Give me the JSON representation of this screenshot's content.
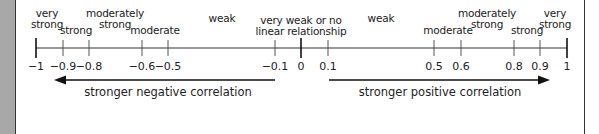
{
  "diagram": {
    "type": "correlation-strength-scale",
    "axis": {
      "min": -1,
      "max": 1
    },
    "ticks": [
      {
        "value": -1,
        "label": "−1",
        "x": 36,
        "major": true
      },
      {
        "value": -0.9,
        "label": "−0.9",
        "x": 63
      },
      {
        "value": -0.8,
        "label": "−0.8",
        "x": 89
      },
      {
        "value": -0.6,
        "label": "−0.6",
        "x": 142
      },
      {
        "value": -0.5,
        "label": "−0.5",
        "x": 168
      },
      {
        "value": -0.1,
        "label": "−0.1",
        "x": 275
      },
      {
        "value": 0,
        "label": "0",
        "x": 301,
        "major": true
      },
      {
        "value": 0.1,
        "label": "0.1",
        "x": 328
      },
      {
        "value": 0.5,
        "label": "0.5",
        "x": 434
      },
      {
        "value": 0.6,
        "label": "0.6",
        "x": 461
      },
      {
        "value": 0.8,
        "label": "0.8",
        "x": 514
      },
      {
        "value": 0.9,
        "label": "0.9",
        "x": 540
      },
      {
        "value": 1,
        "label": "1",
        "x": 567,
        "major": true
      }
    ],
    "regions": [
      {
        "label_line1": "very",
        "label_line2": "strong",
        "x": 47,
        "top": 8
      },
      {
        "label_line1": "",
        "label_line2": "strong",
        "x": 76,
        "top": 25
      },
      {
        "label_line1": "moderately",
        "label_line2": "strong",
        "x": 115,
        "top": 8
      },
      {
        "label_line1": "",
        "label_line2": "moderate",
        "x": 155,
        "top": 25
      },
      {
        "label_line1": "",
        "label_line2": "weak",
        "x": 222,
        "top": 13
      },
      {
        "label_line1": "very weak or no",
        "label_line2": "linear relationship",
        "x": 301,
        "top": 15
      },
      {
        "label_line1": "",
        "label_line2": "weak",
        "x": 381,
        "top": 13
      },
      {
        "label_line1": "",
        "label_line2": "moderate",
        "x": 448,
        "top": 25
      },
      {
        "label_line1": "moderately",
        "label_line2": "strong",
        "x": 487,
        "top": 8
      },
      {
        "label_line1": "",
        "label_line2": "strong",
        "x": 527,
        "top": 25
      },
      {
        "label_line1": "very",
        "label_line2": "strong",
        "x": 555,
        "top": 8
      }
    ],
    "arrows": {
      "negative": {
        "label": "stronger negative correlation",
        "from": 275,
        "to": 55
      },
      "positive": {
        "label": "stronger positive correlation",
        "from": 329,
        "to": 550
      }
    }
  }
}
